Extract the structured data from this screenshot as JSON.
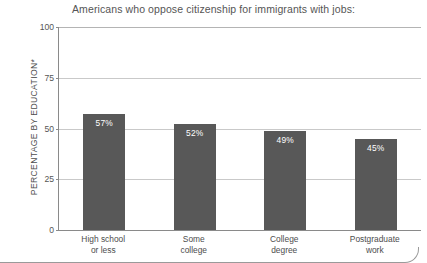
{
  "chart_data": {
    "type": "bar",
    "title": "Americans who oppose citizenship for immigrants with jobs:",
    "xlabel": "",
    "ylabel": "PERCENTAGE BY EDUCATION*",
    "ylim": [
      0,
      100
    ],
    "yticks": [
      "0",
      "25",
      "50",
      "75",
      "100"
    ],
    "grid": true,
    "legend": "none",
    "categories": [
      {
        "line1": "High school",
        "line2": "or less"
      },
      {
        "line1": "Some",
        "line2": "college"
      },
      {
        "line1": "College",
        "line2": "degree"
      },
      {
        "line1": "Postgraduate",
        "line2": "work"
      }
    ],
    "values": [
      57,
      52,
      49,
      45
    ],
    "value_labels": [
      "57%",
      "52%",
      "49%",
      "45%"
    ],
    "bar_color": "#585858",
    "value_label_color": "#ffffff",
    "axis_color": "#8a8a8a",
    "gridline_color": "#c9c9c9"
  }
}
